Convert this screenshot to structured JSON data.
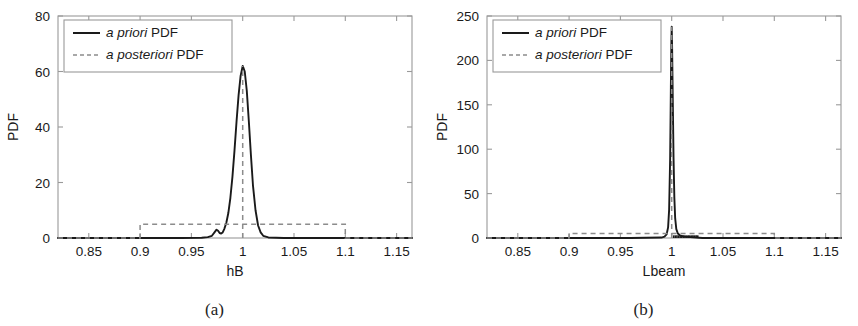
{
  "figure": {
    "panels": [
      {
        "caption": "(a)",
        "legend": [
          {
            "style": "solid",
            "em": "a priori",
            "rest": " PDF"
          },
          {
            "style": "dashed",
            "em": "a posteriori",
            "rest": " PDF"
          }
        ]
      },
      {
        "caption": "(b)",
        "legend": [
          {
            "style": "solid",
            "em": "a priori",
            "rest": " PDF"
          },
          {
            "style": "dashed",
            "em": "a posteriori",
            "rest": " PDF"
          }
        ]
      }
    ]
  },
  "chart_data": [
    {
      "type": "line",
      "panel": "(a)",
      "title": "",
      "xlabel": "hB",
      "ylabel": "PDF",
      "xlim": [
        0.82,
        1.165
      ],
      "ylim": [
        0,
        80
      ],
      "xticks": [
        0.85,
        0.9,
        0.95,
        1,
        1.05,
        1.1,
        1.15
      ],
      "xticklabels": [
        "0.85",
        "0.9",
        "0.95",
        "1",
        "1.05",
        "1.1",
        "1.15"
      ],
      "yticks": [
        0,
        20,
        40,
        60,
        80
      ],
      "yticklabels": [
        "0",
        "20",
        "40",
        "60",
        "80"
      ],
      "grid": false,
      "legend_position": "upper left",
      "series": [
        {
          "name": "a priori PDF",
          "style": "solid",
          "color": "#1a1a1a",
          "x": [
            0.82,
            0.9,
            0.94,
            0.96,
            0.966,
            0.97,
            0.9725,
            0.9745,
            0.976,
            0.9775,
            0.979,
            0.9805,
            0.982,
            0.984,
            0.986,
            0.988,
            0.99,
            0.992,
            0.994,
            0.996,
            0.998,
            1.0,
            1.002,
            1.004,
            1.006,
            1.008,
            1.01,
            1.0125,
            1.015,
            1.0175,
            1.02,
            1.025,
            1.04,
            1.08,
            1.165
          ],
          "y": [
            0.0,
            0.0,
            0.0,
            0.1,
            0.3,
            0.8,
            2.0,
            3.0,
            2.6,
            1.8,
            1.6,
            2.0,
            3.2,
            5.4,
            9.0,
            14.5,
            22.0,
            31.5,
            42.0,
            51.5,
            58.5,
            62.0,
            60.0,
            53.0,
            42.0,
            30.0,
            19.0,
            10.0,
            4.5,
            2.0,
            0.8,
            0.2,
            0.0,
            0.0,
            0.0
          ]
        },
        {
          "name": "a posteriori PDF",
          "style": "dashed",
          "color": "#8c8c8c",
          "description": "uniform distribution over [0.9, 1.1] at height 5, plus vertical dashed marker at x=1",
          "x": [
            0.82,
            0.9,
            0.9,
            1.1,
            1.1,
            1.165
          ],
          "y": [
            0.0,
            0.0,
            5.0,
            5.0,
            0.0,
            0.0
          ],
          "marker_x": 1.0,
          "marker_y_top": 62.0
        }
      ]
    },
    {
      "type": "line",
      "panel": "(b)",
      "title": "",
      "xlabel": "Lbeam",
      "ylabel": "PDF",
      "xlim": [
        0.82,
        1.165
      ],
      "ylim": [
        0,
        250
      ],
      "xticks": [
        0.85,
        0.9,
        0.95,
        1,
        1.05,
        1.1,
        1.15
      ],
      "xticklabels": [
        "0.85",
        "0.9",
        "0.95",
        "1",
        "1.05",
        "1.1",
        "1.15"
      ],
      "yticks": [
        0,
        50,
        100,
        150,
        200,
        250
      ],
      "yticklabels": [
        "0",
        "50",
        "100",
        "150",
        "200",
        "250"
      ],
      "grid": false,
      "legend_position": "upper left",
      "series": [
        {
          "name": "a priori PDF",
          "style": "solid",
          "color": "#1a1a1a",
          "x": [
            0.82,
            0.96,
            0.99,
            0.993,
            0.995,
            0.9965,
            0.9975,
            0.9985,
            0.9992,
            0.9997,
            1.0,
            1.0004,
            1.001,
            1.0018,
            1.0026,
            1.0034,
            1.0045,
            1.006,
            1.008,
            1.012,
            1.03,
            1.1,
            1.165
          ],
          "y": [
            0.0,
            0.0,
            0.5,
            1.5,
            4.0,
            12.0,
            32.0,
            90.0,
            170.0,
            222.0,
            238.0,
            215.0,
            160.0,
            90.0,
            45.0,
            22.0,
            10.0,
            5.0,
            3.0,
            1.5,
            0.0,
            0.0,
            0.0
          ]
        },
        {
          "name": "a posteriori PDF",
          "style": "dashed",
          "color": "#8c8c8c",
          "description": "uniform distribution over [0.9, 1.1] at height 5, plus vertical dashed marker at x=1",
          "x": [
            0.82,
            0.9,
            0.9,
            1.1,
            1.1,
            1.165
          ],
          "y": [
            0.0,
            0.0,
            5.0,
            5.0,
            0.0,
            0.0
          ],
          "marker_x": 1.0,
          "marker_y_top": 238.0
        }
      ],
      "annotations": [
        {
          "name": "baseline-noise-cluster",
          "x_range": [
            1.002,
            1.026
          ],
          "y": 3.0
        }
      ]
    }
  ]
}
